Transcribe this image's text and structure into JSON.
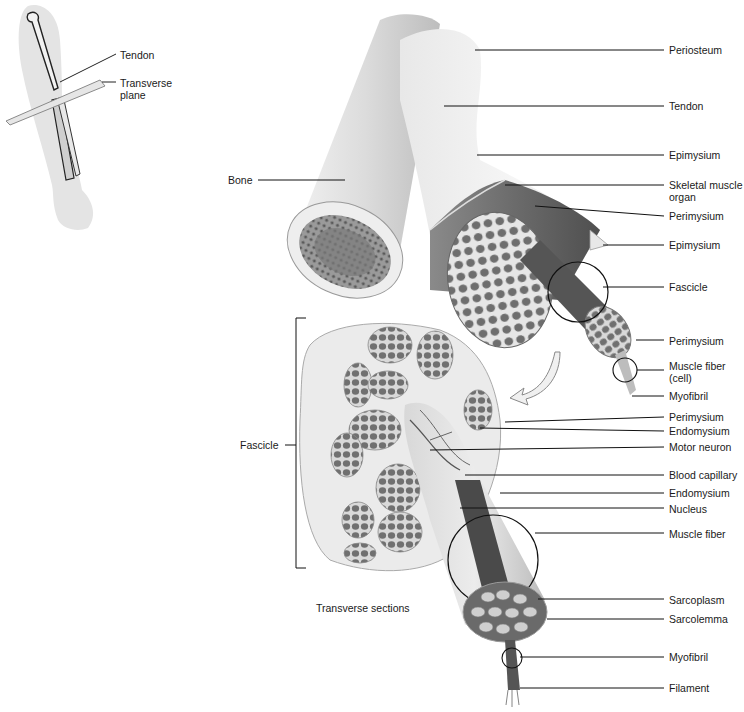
{
  "inset": {
    "labels": [
      {
        "id": "tendon",
        "text": "Tendon"
      },
      {
        "id": "transverse-plane",
        "text": "Transverse plane"
      }
    ]
  },
  "left_labels": {
    "bone": "Bone",
    "fascicle": "Fascicle",
    "caption": "Transverse sections"
  },
  "right_labels": [
    {
      "text": "Periosteum",
      "y": 22
    },
    {
      "text": "Tendon",
      "y": 106
    },
    {
      "text": "Epimysium",
      "y": 155
    },
    {
      "text": "Skeletal muscle organ",
      "y": 185
    },
    {
      "text": "Perimysium",
      "y": 216
    },
    {
      "text": "Epimysium",
      "y": 245
    },
    {
      "text": "Fascicle",
      "y": 288
    },
    {
      "text": "Perimysium",
      "y": 341
    },
    {
      "text": "Muscle fiber (cell)",
      "y": 366
    },
    {
      "text": "Myofibril",
      "y": 396
    },
    {
      "text": "Perimysium",
      "y": 417
    },
    {
      "text": "Endomysium",
      "y": 431
    },
    {
      "text": "Motor neuron",
      "y": 447
    },
    {
      "text": "Blood capillary",
      "y": 476
    },
    {
      "text": "Endomysium",
      "y": 493
    },
    {
      "text": "Nucleus",
      "y": 509
    },
    {
      "text": "Muscle fiber",
      "y": 534
    },
    {
      "text": "Sarcoplasm",
      "y": 600
    },
    {
      "text": "Sarcolemma",
      "y": 620
    },
    {
      "text": "Myofibril",
      "y": 658
    },
    {
      "text": "Filament",
      "y": 688
    }
  ]
}
